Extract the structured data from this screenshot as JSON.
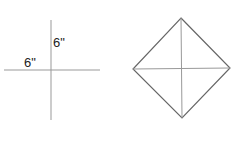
{
  "diagram": {
    "left_figure": {
      "type": "crossed-lines",
      "horizontal_label": "6\"",
      "vertical_label": "6\"",
      "line_color": "#999999"
    },
    "right_figure": {
      "type": "square-rotated-45-with-diagonals",
      "edge_color": "#666666",
      "diagonal_color": "#999999"
    },
    "background": "#ffffff"
  }
}
